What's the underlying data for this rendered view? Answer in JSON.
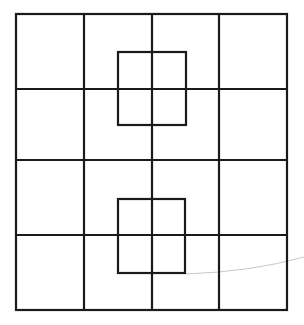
{
  "diagram": {
    "stroke_color": "#1a1a1a",
    "stroke_width": 2.2,
    "background": "#ffffff",
    "outer_square": {
      "x": 16,
      "y": 14,
      "width": 271,
      "height": 296
    },
    "grid": {
      "rows": 4,
      "cols": 4,
      "vertical_lines_x": [
        84,
        152,
        219
      ],
      "horizontal_lines_y": [
        89,
        160,
        235
      ]
    },
    "inner_squares": [
      {
        "name": "upper-inner-square",
        "x": 118,
        "y": 52,
        "width": 68,
        "height": 73
      },
      {
        "name": "lower-inner-square",
        "x": 118,
        "y": 199,
        "width": 67,
        "height": 74
      }
    ],
    "artifact_curve": {
      "color": "#c8c8c8",
      "path": "M 185 274 Q 250 272 304 257"
    }
  }
}
